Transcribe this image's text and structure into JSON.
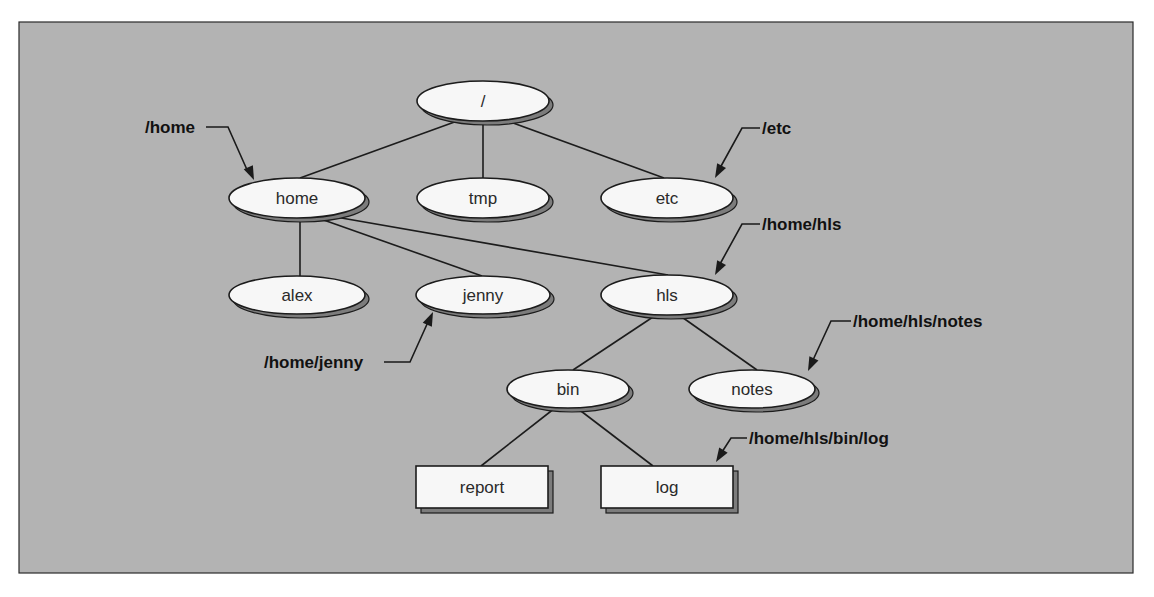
{
  "diagram": {
    "colors": {
      "background": "#b3b3b3",
      "node_fill": "#f7f7f7",
      "node_shadow": "#7c7c7c",
      "stroke": "#1c1c1c"
    },
    "nodes": [
      {
        "id": "root",
        "label": "/",
        "shape": "ellipse",
        "cx": 483,
        "cy": 101,
        "rx": 66,
        "ry": 20
      },
      {
        "id": "home",
        "label": "home",
        "shape": "ellipse",
        "cx": 297,
        "cy": 198,
        "rx": 68,
        "ry": 20
      },
      {
        "id": "tmp",
        "label": "tmp",
        "shape": "ellipse",
        "cx": 483,
        "cy": 198,
        "rx": 66,
        "ry": 20
      },
      {
        "id": "etc",
        "label": "etc",
        "shape": "ellipse",
        "cx": 667,
        "cy": 198,
        "rx": 66,
        "ry": 20
      },
      {
        "id": "alex",
        "label": "alex",
        "shape": "ellipse",
        "cx": 297,
        "cy": 295,
        "rx": 68,
        "ry": 19
      },
      {
        "id": "jenny",
        "label": "jenny",
        "shape": "ellipse",
        "cx": 483,
        "cy": 295,
        "rx": 67,
        "ry": 19
      },
      {
        "id": "hls",
        "label": "hls",
        "shape": "ellipse",
        "cx": 667,
        "cy": 295,
        "rx": 66,
        "ry": 20
      },
      {
        "id": "bin",
        "label": "bin",
        "shape": "ellipse",
        "cx": 568,
        "cy": 389,
        "rx": 61,
        "ry": 19
      },
      {
        "id": "notes",
        "label": "notes",
        "shape": "ellipse",
        "cx": 752,
        "cy": 389,
        "rx": 63,
        "ry": 19
      },
      {
        "id": "report",
        "label": "report",
        "shape": "rect",
        "x": 416,
        "y": 466,
        "w": 132,
        "h": 42
      },
      {
        "id": "log",
        "label": "log",
        "shape": "rect",
        "x": 601,
        "y": 466,
        "w": 132,
        "h": 42
      }
    ],
    "edges": [
      {
        "from": "root",
        "to": "home",
        "x1": 460,
        "y1": 120,
        "x2": 300,
        "y2": 178
      },
      {
        "from": "root",
        "to": "tmp",
        "x1": 483,
        "y1": 122,
        "x2": 483,
        "y2": 178
      },
      {
        "from": "root",
        "to": "etc",
        "x1": 505,
        "y1": 120,
        "x2": 664,
        "y2": 178
      },
      {
        "from": "home",
        "to": "alex",
        "x1": 300,
        "y1": 219,
        "x2": 300,
        "y2": 276
      },
      {
        "from": "home",
        "to": "jenny",
        "x1": 318,
        "y1": 218,
        "x2": 482,
        "y2": 276
      },
      {
        "from": "home",
        "to": "hls",
        "x1": 330,
        "y1": 216,
        "x2": 668,
        "y2": 275
      },
      {
        "from": "hls",
        "to": "bin",
        "x1": 656,
        "y1": 315,
        "x2": 573,
        "y2": 370
      },
      {
        "from": "hls",
        "to": "notes",
        "x1": 679,
        "y1": 315,
        "x2": 757,
        "y2": 370
      },
      {
        "from": "bin",
        "to": "report",
        "x1": 555,
        "y1": 408,
        "x2": 481,
        "y2": 466
      },
      {
        "from": "bin",
        "to": "log",
        "x1": 577,
        "y1": 408,
        "x2": 653,
        "y2": 466
      }
    ],
    "callouts": [
      {
        "id": "home",
        "label": "/home",
        "text_x": 145,
        "text_y": 127,
        "path": "M 206 127 L 228 127 L 248 172",
        "tip_x": 254,
        "tip_y": 180,
        "angle": 66
      },
      {
        "id": "etc",
        "label": "/etc",
        "text_x": 762,
        "text_y": 128,
        "path": "M 760 128 L 742 128 L 720 168",
        "tip_x": 715,
        "tip_y": 178,
        "angle": 118
      },
      {
        "id": "hls",
        "label": "/home/hls",
        "text_x": 762,
        "text_y": 224,
        "path": "M 760 224 L 742 224 L 720 264",
        "tip_x": 715,
        "tip_y": 275,
        "angle": 118
      },
      {
        "id": "jenny",
        "label": "/home/jenny",
        "text_x": 264,
        "text_y": 362,
        "path": "M 384 362 L 410 362 L 428 322",
        "tip_x": 433,
        "tip_y": 312,
        "angle": -66
      },
      {
        "id": "notes",
        "label": "/home/hls/notes",
        "text_x": 853,
        "text_y": 321,
        "path": "M 851 321 L 831 321 L 813 360",
        "tip_x": 808,
        "tip_y": 371,
        "angle": 115
      },
      {
        "id": "log",
        "label": "/home/hls/bin/log",
        "text_x": 749,
        "text_y": 438,
        "path": "M 747 438 L 731 438 L 722 452",
        "tip_x": 716,
        "tip_y": 462,
        "angle": 122
      }
    ]
  }
}
